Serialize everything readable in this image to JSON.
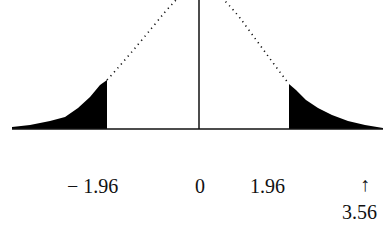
{
  "diagram": {
    "type": "normal-distribution",
    "center_value": "0",
    "critical_values": [
      "-1.96",
      "1.96"
    ],
    "observed_value": "3.56",
    "colors": {
      "curve": "#111111",
      "shade": "#000000",
      "background": "#ffffff"
    }
  },
  "labels": {
    "left_critical": "− 1.96",
    "center": "0",
    "right_critical": "1.96",
    "arrow": "↑",
    "observed": "3.56"
  }
}
